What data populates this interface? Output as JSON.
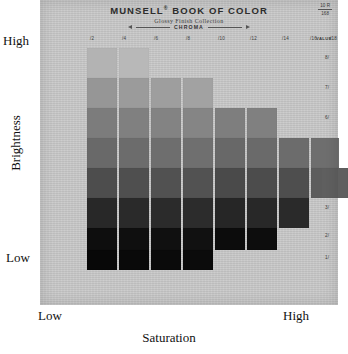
{
  "figure": {
    "type": "munsell-color-chart",
    "y_axis": {
      "label": "Brightness",
      "high_label": "High",
      "low_label": "Low"
    },
    "x_axis": {
      "label": "Saturation",
      "low_label": "Low",
      "high_label": "High"
    }
  },
  "page": {
    "brand": "MUNSELL",
    "brand_sup": "®",
    "brand_rest": " BOOK OF COLOR",
    "subtitle": "Glossy Finish Collection",
    "chroma_axis_label": "CHROMA",
    "hue_ref": "10 R",
    "page_ref": "168",
    "value_column_caption": "VALUE"
  },
  "chart_data": {
    "type": "heatmap",
    "title": "MUNSELL® BOOK OF COLOR",
    "subtitle": "Glossy Finish Collection",
    "xlabel": "Saturation",
    "ylabel": "Brightness",
    "x_axis_name": "CHROMA",
    "y_axis_name": "VALUE",
    "grid": false,
    "legend": "none",
    "columns": [
      "/2",
      "/4",
      "/6",
      "/8",
      "/10",
      "/12",
      "/14",
      "/16",
      "/18"
    ],
    "rows": [
      "8/",
      "7/",
      "6/",
      "5/",
      "4/",
      "3/",
      "2/",
      "1/"
    ],
    "note": "Grayscale reproduction of a Munsell 10R hue page. Cells give the sampled gray level (0-255) of each printed chip; null = no chip printed at that chroma/value.",
    "cells": [
      [
        179,
        184,
        null,
        null,
        null,
        null,
        null,
        null,
        null
      ],
      [
        150,
        155,
        158,
        162,
        null,
        null,
        null,
        null,
        null
      ],
      [
        124,
        128,
        131,
        133,
        126,
        128,
        null,
        null,
        null
      ],
      [
        105,
        108,
        110,
        111,
        104,
        106,
        108,
        110,
        null
      ],
      [
        77,
        79,
        81,
        82,
        74,
        76,
        78,
        93,
        95
      ],
      [
        40,
        42,
        43,
        44,
        38,
        40,
        42,
        null,
        null
      ],
      [
        14,
        15,
        16,
        17,
        12,
        13,
        null,
        null,
        null
      ],
      [
        8,
        9,
        10,
        11,
        null,
        null,
        null,
        null,
        null
      ]
    ],
    "column_extents": [
      {
        "chroma": "/2",
        "top_row": "7/",
        "bottom_row": "1/"
      },
      {
        "chroma": "/4",
        "top_row": "7/",
        "bottom_row": "1/"
      },
      {
        "chroma": "/6",
        "top_row": "6/",
        "bottom_row": "1/"
      },
      {
        "chroma": "/8",
        "top_row": "6/",
        "bottom_row": "1/"
      },
      {
        "chroma": "/10",
        "top_row": "5/",
        "bottom_row": "2/"
      },
      {
        "chroma": "/12",
        "top_row": "5/",
        "bottom_row": "2/"
      },
      {
        "chroma": "/14",
        "top_row": "4/",
        "bottom_row": "3/"
      },
      {
        "chroma": "/16",
        "top_row": "4/",
        "bottom_row": "4/"
      },
      {
        "chroma": "/18",
        "top_row": "4/",
        "bottom_row": "4/"
      }
    ]
  },
  "colors": {
    "paper": "#c9c9c9",
    "ink": "#2d2d2d",
    "axis_text": "#111111"
  },
  "geometry": {
    "col_x": [
      47,
      79,
      111,
      143,
      175,
      207,
      239,
      271,
      281
    ],
    "col_w": [
      30,
      30,
      30,
      30,
      30,
      30,
      30,
      28,
      27
    ],
    "row_y": [
      48,
      78,
      108,
      138,
      168,
      198,
      228,
      250
    ],
    "row_h": [
      30,
      30,
      30,
      30,
      30,
      30,
      22,
      20
    ],
    "tick_x": [
      56,
      88,
      120,
      152,
      184,
      216,
      248,
      276,
      296
    ],
    "tickv_y": [
      10,
      40,
      70,
      100,
      130,
      160,
      188,
      210
    ]
  }
}
